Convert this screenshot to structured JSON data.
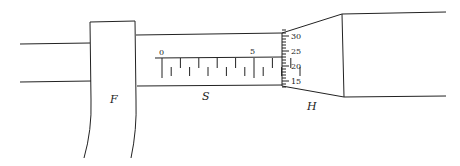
{
  "diagram": {
    "labels": {
      "frame": "F",
      "sleeve": "S",
      "thimble": "H"
    },
    "main_scale": {
      "labels": [
        "0",
        "5"
      ],
      "upper_ticks_mm": [
        0,
        1,
        2,
        3,
        4,
        5,
        6,
        7
      ],
      "lower_ticks_halfmm": [
        0.5,
        1.5,
        2.5,
        3.5,
        4.5,
        5.5,
        6.5,
        7.5
      ]
    },
    "thimble_scale": {
      "labels": [
        "30",
        "25",
        "20",
        "15"
      ],
      "label_values": [
        30,
        25,
        20,
        15
      ],
      "min": 13,
      "max": 32,
      "index_line_value": 22
    }
  }
}
